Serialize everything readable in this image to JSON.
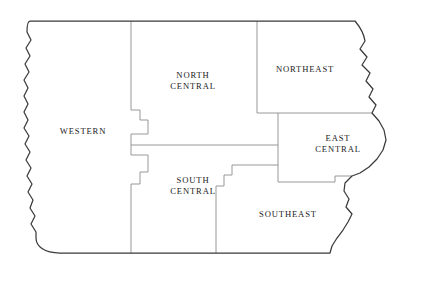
{
  "map": {
    "title": "Iowa Regions Map",
    "subject": "Iowa",
    "background_color": "#ffffff",
    "outline_color": "#3a3a3a",
    "divider_color": "#8d8d8d",
    "label_color": "#222222",
    "region_count": 6,
    "regions": [
      {
        "id": "western",
        "label": "WESTERN",
        "label_x": 83,
        "label_y": 131
      },
      {
        "id": "north-central",
        "label": "NORTH\nCENTRAL",
        "label_x": 193,
        "label_y": 80
      },
      {
        "id": "northeast",
        "label": "NORTHEAST",
        "label_x": 305,
        "label_y": 69
      },
      {
        "id": "east-central",
        "label": "EAST\nCENTRAL",
        "label_x": 338,
        "label_y": 143
      },
      {
        "id": "south-central",
        "label": "SOUTH\nCENTRAL",
        "label_x": 193,
        "label_y": 185
      },
      {
        "id": "southeast",
        "label": "SOUTHEAST",
        "label_x": 288,
        "label_y": 214
      }
    ]
  }
}
